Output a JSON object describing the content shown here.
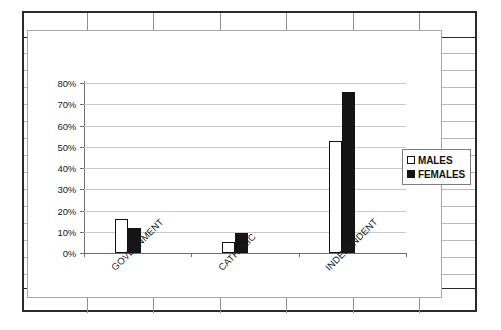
{
  "chart_data": {
    "type": "bar",
    "title": "",
    "xlabel": "",
    "ylabel": "",
    "categories": [
      "GOVERNMENT",
      "CATHOLIC",
      "INDEPENDENT"
    ],
    "series": [
      {
        "name": "MALES",
        "values": [
          16,
          5,
          52.5
        ]
      },
      {
        "name": "FEMALES",
        "values": [
          12,
          9.5,
          76
        ]
      }
    ],
    "ylim": [
      0,
      80
    ],
    "ytick_values": [
      0,
      10,
      20,
      30,
      40,
      50,
      60,
      70,
      80
    ],
    "ytick_labels": [
      "0%",
      "10%",
      "20%",
      "30%",
      "40%",
      "50%",
      "60%",
      "70%",
      "80%"
    ],
    "grid": true,
    "legend_position": "right",
    "value_format": "percent",
    "series_colors": {
      "MALES": "#ffffff",
      "FEMALES": "#141414"
    },
    "gridline_color": "#c9c9c9",
    "axis_color": "#6f6f6f"
  },
  "legend": {
    "items": [
      {
        "label": "MALES",
        "swatch": "hollow-square-swatch"
      },
      {
        "label": "FEMALES",
        "swatch": "filled-square-swatch"
      }
    ]
  },
  "axis": {
    "y_labels": [
      "80%",
      "70%",
      "60%",
      "50%",
      "40%",
      "30%",
      "20%",
      "10%",
      "0%"
    ],
    "x_labels": [
      "GOVERNMENT",
      "CATHOLIC",
      "INDEPENDENT"
    ]
  }
}
